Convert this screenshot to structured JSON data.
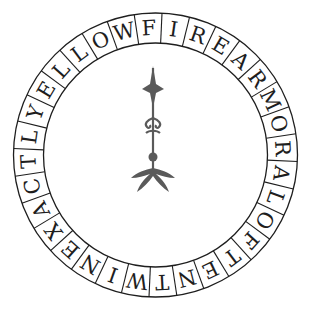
{
  "puzzle": {
    "letters": [
      "F",
      "I",
      "R",
      "E",
      "A",
      "R",
      "M",
      "O",
      "R",
      "A",
      "L",
      "O",
      "F",
      "T",
      "E",
      "N",
      "T",
      "W",
      "I",
      "N",
      "E",
      "X",
      "A",
      "C",
      "T",
      "L",
      "Y",
      "E",
      "L",
      "L",
      "O",
      "W"
    ],
    "start_angle_deg": -3,
    "ring": {
      "cx": 155.5,
      "cy": 155,
      "outer_r": 142,
      "inner_r": 112
    },
    "colors": {
      "ink": "#1e1e1e",
      "ornament": "#5a5a5a",
      "background": "#ffffff"
    }
  }
}
